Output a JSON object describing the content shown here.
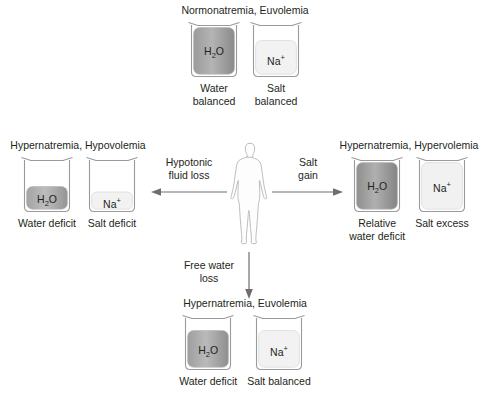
{
  "diagram": {
    "title_icon": "beaker-icon",
    "center": {
      "figure_icon": "human-body-icon"
    },
    "quadrants": {
      "top": {
        "title": "Normonatremia, Euvolemia",
        "beakers": [
          {
            "symbol": "H2O",
            "caption_line1": "Water",
            "caption_line2": "balanced",
            "fill": "water",
            "level": 100
          },
          {
            "symbol": "Na+",
            "caption_line1": "Salt",
            "caption_line2": "balanced",
            "fill": "salt",
            "level": 72
          }
        ]
      },
      "left": {
        "title": "Hypernatremia, Hypovolemia",
        "beakers": [
          {
            "symbol": "H2O",
            "caption_line1": "Water deficit",
            "caption_line2": "",
            "fill": "water",
            "level": 44
          },
          {
            "symbol": "Na+",
            "caption_line1": "Salt deficit",
            "caption_line2": "",
            "fill": "salt",
            "level": 33
          }
        ]
      },
      "right": {
        "title": "Hypernatremia, Hypervolemia",
        "beakers": [
          {
            "symbol": "H2O",
            "caption_line1": "Relative",
            "caption_line2": "water deficit",
            "fill": "water",
            "level": 100
          },
          {
            "symbol": "Na+",
            "caption_line1": "Salt excess",
            "caption_line2": "",
            "fill": "salt",
            "level": 100
          }
        ]
      },
      "bottom": {
        "title": "Hypernatremia, Euvolemia",
        "beakers": [
          {
            "symbol": "H2O",
            "caption_line1": "Water deficit",
            "caption_line2": "",
            "fill": "water",
            "level": 78
          },
          {
            "symbol": "Na+",
            "caption_line1": "Salt balanced",
            "caption_line2": "",
            "fill": "salt",
            "level": 78
          }
        ]
      }
    },
    "arrows": {
      "left": {
        "label_line1": "Hypotonic",
        "label_line2": "fluid loss",
        "direction": "left"
      },
      "right": {
        "label_line1": "Salt",
        "label_line2": "gain",
        "direction": "right"
      },
      "down": {
        "label_line1": "Free water",
        "label_line2": "loss",
        "direction": "down"
      }
    },
    "colors": {
      "text": "#231f20",
      "outline": "#9a9a9a",
      "water_fill_dark": "#8d8d8d",
      "water_fill_light": "#c9c9c9",
      "salt_fill": "#f1f1f1",
      "arrow": "#6e6e6e"
    }
  }
}
